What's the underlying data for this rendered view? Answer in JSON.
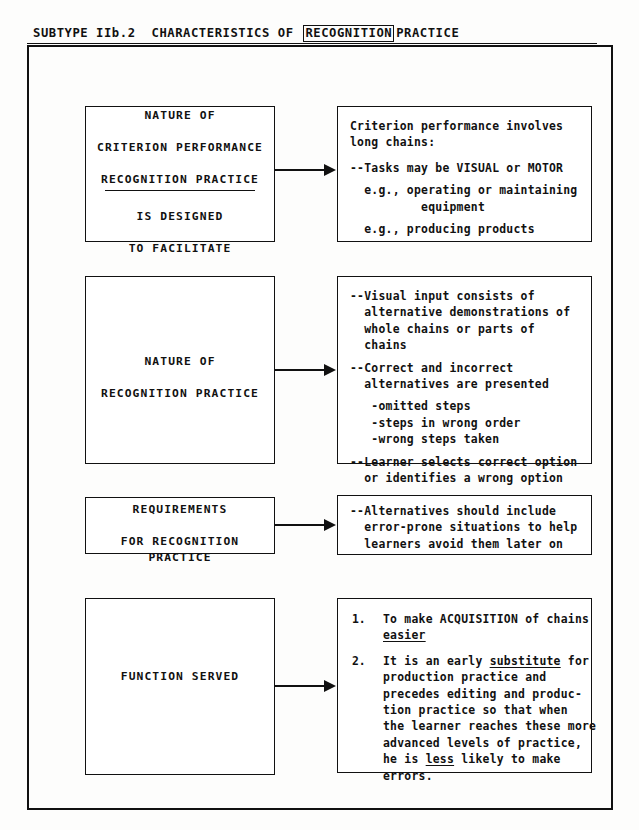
{
  "header": {
    "subtype_label": "SUBTYPE IIb.2",
    "title_before": "CHARACTERISTICS OF",
    "title_boxed_word": "RECOGNITION",
    "title_after": "PRACTICE"
  },
  "rows": [
    {
      "left": {
        "line1": "NATURE OF",
        "line2": "CRITERION PERFORMANCE",
        "line3": "RECOGNITION PRACTICE",
        "line4": "IS DESIGNED",
        "line5": "TO FACILITATE"
      },
      "right": {
        "l1": "Criterion performance involves",
        "l2": "long chains:",
        "l3": "--Tasks may be VISUAL or MOTOR",
        "l4": "  e.g., operating or maintaining",
        "l5": "          equipment",
        "l6": "  e.g., producing products"
      }
    },
    {
      "left": {
        "line1": "NATURE OF",
        "line2": "RECOGNITION PRACTICE"
      },
      "right": {
        "l1": "--Visual input consists of",
        "l2": "  alternative demonstrations of",
        "l3": "  whole chains or parts of",
        "l4": "  chains",
        "l5": "--Correct and incorrect",
        "l6": "  alternatives are presented",
        "l7": "   -omitted steps",
        "l8": "   -steps in wrong order",
        "l9": "   -wrong steps taken",
        "l10": "--Learner selects correct option",
        "l11": "  or identifies a wrong option"
      }
    },
    {
      "left": {
        "line1": "REQUIREMENTS",
        "line2": "FOR RECOGNITION PRACTICE"
      },
      "right": {
        "l1": "--Alternatives should include",
        "l2": "  error-prone situations to help",
        "l3": "  learners avoid them later on"
      }
    },
    {
      "left": {
        "line1": "FUNCTION SERVED"
      },
      "right": {
        "item1_num": "1.",
        "item1_a_pre": "To make ACQUISITION of chains",
        "item1_b_underlined": "easier",
        "item2_num": "2.",
        "item2_a_pre": "It is an early ",
        "item2_a_underlined": "substitute",
        "item2_a_post": " for",
        "item2_b": "production practice and",
        "item2_c": "precedes editing and produc-",
        "item2_d": "tion practice so that when",
        "item2_e": "the learner reaches these more",
        "item2_f": "advanced levels of practice,",
        "item2_g_pre": "he is ",
        "item2_g_underlined": "less",
        "item2_g_post": " likely to make",
        "item2_h": "errors."
      }
    }
  ],
  "colors": {
    "ink": "#111111",
    "paper": "#fdfdfc"
  }
}
